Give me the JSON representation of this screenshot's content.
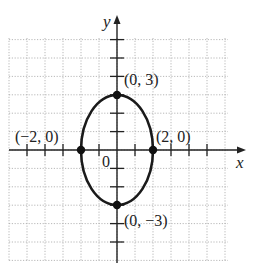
{
  "chart_data": {
    "type": "line",
    "title": "",
    "xlabel": "x",
    "ylabel": "y",
    "origin_label": "0",
    "xlim": [
      -6,
      6
    ],
    "ylim": [
      -6,
      6
    ],
    "grid": true,
    "grid_style": "dotted",
    "curve": {
      "kind": "ellipse",
      "equation": "x^2/4 + y^2/9 = 1",
      "center": [
        0,
        0
      ],
      "semi_x": 2,
      "semi_y": 3
    },
    "points": [
      {
        "x": 0,
        "y": 3,
        "label": "(0, 3)"
      },
      {
        "x": -2,
        "y": 0,
        "label": "(−2, 0)"
      },
      {
        "x": 2,
        "y": 0,
        "label": "(2, 0)"
      },
      {
        "x": 0,
        "y": -3,
        "label": "(0, −3)"
      }
    ],
    "colors": {
      "curve": "#1a1a1a",
      "axis": "#222222",
      "grid": "#b0b0b0"
    }
  }
}
